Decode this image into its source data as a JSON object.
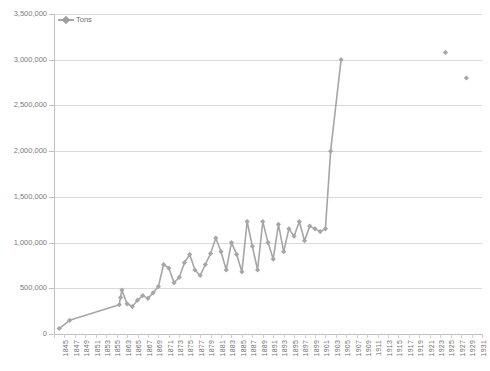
{
  "legend": {
    "label": "Tons",
    "position": "inside-top-left",
    "color": "#a6a6a6"
  },
  "axes": {
    "y_ticks": [
      "0",
      "500,000",
      "1,000,000",
      "1,500,000",
      "2,000,000",
      "2,500,000",
      "3,000,000",
      "3,500,000"
    ],
    "x_ticks": [
      "1845",
      "1847",
      "1849",
      "1851",
      "1853",
      "1855",
      "1863",
      "1865",
      "1867",
      "1869",
      "1871",
      "1873",
      "1875",
      "1877",
      "1879",
      "1881",
      "1883",
      "1885",
      "1887",
      "1889",
      "1891",
      "1893",
      "1895",
      "1897",
      "1899",
      "1901",
      "1903",
      "1905",
      "1907",
      "1909",
      "1911",
      "1913",
      "1915",
      "1917",
      "1919",
      "1921",
      "1923",
      "1925",
      "1927",
      "1929",
      "1931"
    ]
  },
  "chart_data": {
    "type": "line",
    "title": "",
    "xlabel": "",
    "ylabel": "",
    "ylim": [
      0,
      3500000
    ],
    "ytick_step": 500000,
    "grid": true,
    "legend_position": "inside-top-left",
    "series": [
      {
        "name": "Tons",
        "color": "#a6a6a6",
        "marker": "diamond",
        "x": [
          1845,
          1847,
          1861,
          1862,
          1863,
          1864,
          1865,
          1866,
          1867,
          1868,
          1869,
          1870,
          1871,
          1872,
          1873,
          1874,
          1875,
          1876,
          1877,
          1878,
          1879,
          1880,
          1881,
          1882,
          1883,
          1884,
          1885,
          1886,
          1887,
          1888,
          1889,
          1890,
          1891,
          1892,
          1893,
          1894,
          1895,
          1896,
          1897,
          1898,
          1899,
          1900,
          1901,
          1902,
          1903,
          1905
        ],
        "values": [
          60000,
          150000,
          320000,
          400000,
          480000,
          330000,
          300000,
          370000,
          420000,
          390000,
          450000,
          520000,
          760000,
          720000,
          560000,
          620000,
          780000,
          870000,
          700000,
          640000,
          760000,
          880000,
          1050000,
          900000,
          700000,
          1000000,
          870000,
          680000,
          1230000,
          960000,
          700000,
          1230000,
          1000000,
          820000,
          1200000,
          900000,
          1150000,
          1070000,
          1230000,
          1020000,
          1180000,
          1150000,
          1120000,
          1150000,
          2000000,
          3000000
        ]
      },
      {
        "name": "Tons-isolated",
        "color": "#a6a6a6",
        "marker": "diamond",
        "x": [
          1925,
          1929
        ],
        "values": [
          3080000,
          2800000
        ]
      }
    ],
    "annotations": [
      "x-axis year labels skip from 1855 to 1863 (gap in record)",
      "near-vertical rise from 2,000,000 at 1903 to 3,000,000 at 1905",
      "two isolated unconnected markers at 1925 and 1929"
    ]
  }
}
